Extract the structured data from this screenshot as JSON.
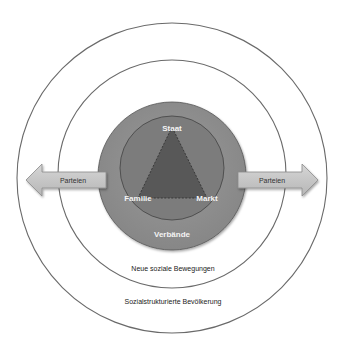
{
  "diagram": {
    "rings": {
      "outer": {
        "label": "Sozialstrukturierte Bevölkerung"
      },
      "middle": {
        "label": "Neue soziale Bewegungen"
      },
      "gray_disc": {
        "label": "Verbände"
      }
    },
    "triangle": {
      "vertices": {
        "top": "Staat",
        "left": "Familie",
        "right": "Markt"
      }
    },
    "arrows": {
      "left": {
        "label": "Parteien"
      },
      "right": {
        "label": "Parteien"
      }
    },
    "colors": {
      "ring_stroke": "#6a6a6a",
      "gray_disc": "#8d8d8d",
      "inner_circle": "#7c7c7c",
      "triangle": "#5a5a5a",
      "arrow_fill": "#c4c4c4",
      "arrow_stroke": "#8a8a8a"
    }
  }
}
